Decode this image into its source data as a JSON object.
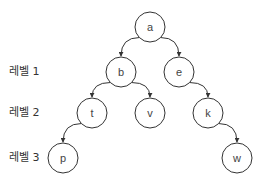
{
  "levels": [
    {
      "label": "레벨 1",
      "y": 72
    },
    {
      "label": "레벨 2",
      "y": 113
    },
    {
      "label": "레벨 3",
      "y": 158
    }
  ],
  "nodes": {
    "a": {
      "label": "a",
      "x": 150,
      "y": 27
    },
    "b": {
      "label": "b",
      "x": 121,
      "y": 72
    },
    "e": {
      "label": "e",
      "x": 179,
      "y": 72
    },
    "t": {
      "label": "t",
      "x": 92,
      "y": 113
    },
    "v": {
      "label": "v",
      "x": 150,
      "y": 113
    },
    "k": {
      "label": "k",
      "x": 208,
      "y": 113
    },
    "p": {
      "label": "p",
      "x": 63,
      "y": 158
    },
    "w": {
      "label": "w",
      "x": 237,
      "y": 158
    }
  },
  "edges": [
    [
      "a",
      "b"
    ],
    [
      "a",
      "e"
    ],
    [
      "b",
      "t"
    ],
    [
      "b",
      "v"
    ],
    [
      "e",
      "k"
    ],
    [
      "t",
      "p"
    ],
    [
      "k",
      "w"
    ]
  ],
  "style": {
    "stroke": "#333333",
    "node_fill": "#ffffff",
    "node_radius": 15
  }
}
